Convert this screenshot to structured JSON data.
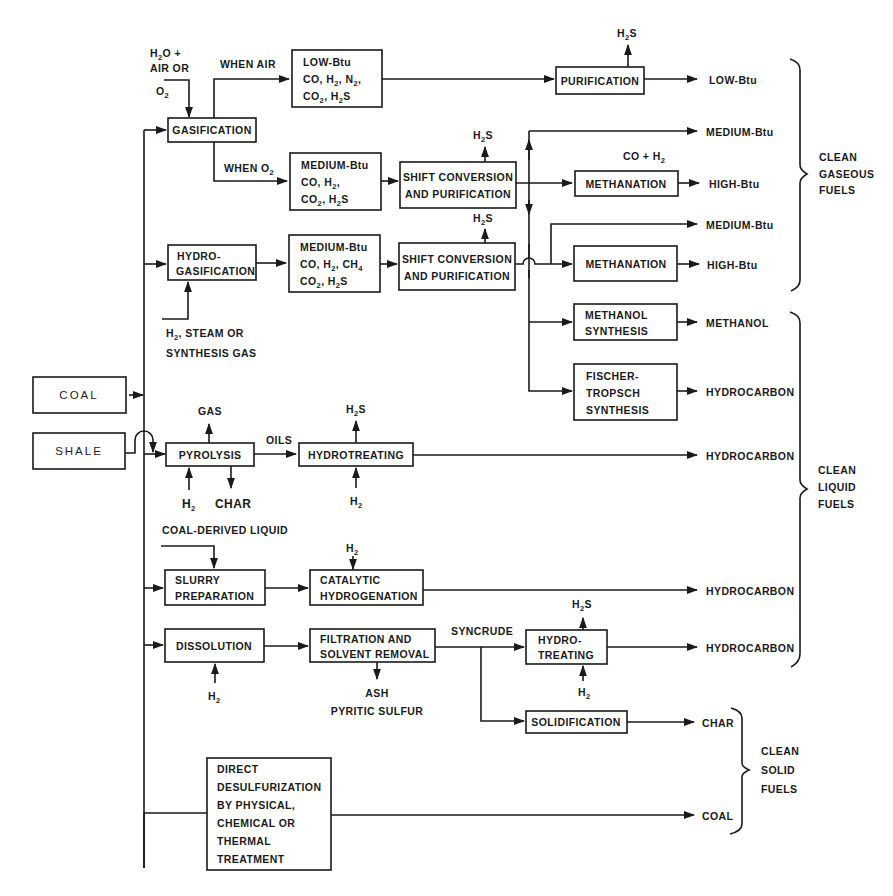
{
  "diagram": {
    "sources": {
      "coal": "COAL",
      "shale": "SHALE"
    },
    "inputs": {
      "gasification_in_1": "H",
      "gasification_in_1_sub": "2",
      "gasification_in_1_rest": "O +",
      "gasification_in_2": "AIR OR",
      "gasification_in_3": "O",
      "gasification_in_3_sub": "2",
      "hydrogasification_in_1": "H",
      "hydrogasification_in_1_sub": "2",
      "hydrogasification_in_1_rest": ", STEAM OR",
      "hydrogasification_in_2": "SYNTHESIS GAS",
      "coal_derived_liquid": "COAL-DERIVED LIQUID"
    },
    "branch_labels": {
      "when_air": "WHEN AIR",
      "when_o2": "WHEN O",
      "when_o2_sub": "2",
      "oils": "OILS",
      "syncrude": "SYNCRUDE"
    },
    "processes": {
      "gasification": "GASIFICATION",
      "hydrogasification": [
        "HYDRO-",
        "GASIFICATION"
      ],
      "low_btu_gas": [
        "LOW-Btu",
        "CO, H2, N2,",
        "CO2, H2S"
      ],
      "medium_btu_gas_1": [
        "MEDIUM-Btu",
        "CO, H2,",
        "CO2, H2S"
      ],
      "medium_btu_gas_2": [
        "MEDIUM-Btu",
        "CO, H2, CH4",
        "CO2, H2S"
      ],
      "purification": "PURIFICATION",
      "shift_conversion_1": [
        "SHIFT CONVERSION",
        "AND PURIFICATION"
      ],
      "shift_conversion_2": [
        "SHIFT CONVERSION",
        "AND PURIFICATION"
      ],
      "methanation_1": "METHANATION",
      "methanation_2": "METHANATION",
      "methanol_synthesis": [
        "METHANOL",
        "SYNTHESIS"
      ],
      "fischer_tropsch": [
        "FISCHER-",
        "TROPSCH",
        "SYNTHESIS"
      ],
      "pyrolysis": "PYROLYSIS",
      "hydrotreating": "HYDROTREATING",
      "slurry_preparation": [
        "SLURRY",
        "PREPARATION"
      ],
      "catalytic_hydrogenation": [
        "CATALYTIC",
        "HYDROGENATION"
      ],
      "dissolution": "DISSOLUTION",
      "filtration": [
        "FILTRATION AND",
        "SOLVENT REMOVAL"
      ],
      "hydro_treating": [
        "HYDRO-",
        "TREATING"
      ],
      "solidification": "SOLIDIFICATION",
      "direct_desulfurization": [
        "DIRECT",
        "DESULFURIZATION",
        "BY PHYSICAL,",
        "CHEMICAL OR",
        "THERMAL",
        "TREATMENT"
      ]
    },
    "byproducts": {
      "h2s": "H",
      "h2s_sub": "2",
      "h2s_rest": "S",
      "h2": "H",
      "h2_sub": "2",
      "gas": "GAS",
      "char": "CHAR",
      "co_h2": "CO + H",
      "co_h2_sub": "2",
      "ash": "ASH",
      "pyritic_sulfur": "PYRITIC SULFUR"
    },
    "products": {
      "low_btu": "LOW-Btu",
      "medium_btu_1": "MEDIUM-Btu",
      "high_btu_1": "HIGH-Btu",
      "medium_btu_2": "MEDIUM-Btu",
      "high_btu_2": "HIGH-Btu",
      "methanol": "METHANOL",
      "hydrocarbon_ft": "HYDROCARBON",
      "hydrocarbon_pyrolysis": "HYDROCARBON",
      "hydrocarbon_catalytic": "HYDROCARBON",
      "hydrocarbon_syncrude": "HYDROCARBON",
      "char": "CHAR",
      "coal": "COAL"
    },
    "categories": {
      "gaseous": [
        "CLEAN",
        "GASEOUS",
        "FUELS"
      ],
      "liquid": [
        "CLEAN",
        "LIQUID",
        "FUELS"
      ],
      "solid": [
        "CLEAN",
        "SOLID",
        "FUELS"
      ]
    }
  },
  "colors": {
    "ink": "#1a1a1a",
    "background": "#ffffff"
  }
}
